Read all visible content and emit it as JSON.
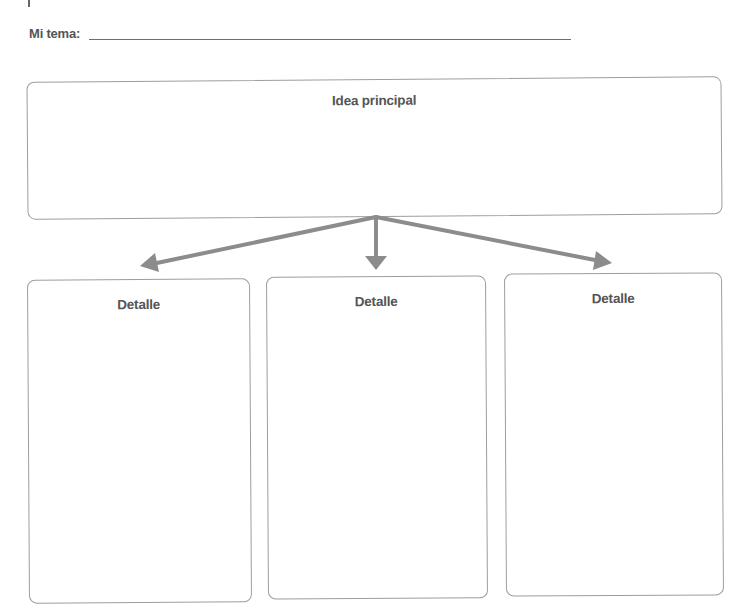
{
  "worksheet": {
    "topic": {
      "label": "Mi tema:",
      "value": ""
    },
    "main_idea": {
      "title": "Idea principal",
      "content": ""
    },
    "details": [
      {
        "title": "Detalle",
        "content": ""
      },
      {
        "title": "Detalle",
        "content": ""
      },
      {
        "title": "Detalle",
        "content": ""
      }
    ],
    "colors": {
      "text": "#555555",
      "box_border": "#9d9d9d",
      "arrow": "#8c8c8c",
      "line": "#6e6e6e"
    }
  }
}
